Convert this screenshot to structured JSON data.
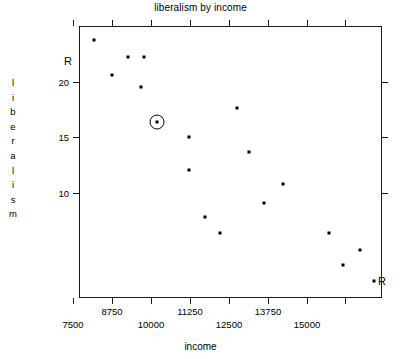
{
  "chart_data": {
    "type": "scatter",
    "title": "liberalism by income",
    "xlabel": "income",
    "ylabel": "liberalism",
    "xlim": [
      6900,
      16200
    ],
    "ylim": [
      7.1,
      23.6
    ],
    "grid": false,
    "legend": null,
    "xticks": [
      7500,
      8750,
      10000,
      11250,
      12500,
      13750,
      15000
    ],
    "xtick_labels": [
      "7500",
      "8750",
      "10000",
      "11250",
      "12500",
      "13750",
      "15000"
    ],
    "yticks": [
      20,
      15,
      10
    ],
    "ytick_labels": [
      "20",
      "15",
      "10"
    ],
    "x": [
      7960,
      9050,
      9560,
      8710,
      9470,
      10260,
      11810,
      10980,
      12230,
      10980,
      11460,
      12040,
      13050,
      13530,
      14700,
      15240,
      15720
    ],
    "y": [
      23.3,
      21.8,
      21.8,
      21.3,
      20.2,
      18.1,
      19.1,
      17.2,
      16.2,
      15.1,
      14.1,
      12.1,
      13.0,
      11.1,
      11.1,
      9.3,
      10.1
    ],
    "points": [
      {
        "x": 7960,
        "y": 23.3,
        "px": 94,
        "py": 40,
        "highlighted": false
      },
      {
        "x": 9050,
        "y": 21.8,
        "px": 128,
        "py": 57,
        "highlighted": false
      },
      {
        "x": 9560,
        "y": 21.8,
        "px": 144,
        "py": 57,
        "highlighted": false
      },
      {
        "x": 8710,
        "y": 21.3,
        "px": 112,
        "py": 75,
        "highlighted": false
      },
      {
        "x": 9470,
        "y": 20.2,
        "px": 141,
        "py": 87,
        "highlighted": false
      },
      {
        "x": 10260,
        "y": 18.1,
        "px": 157,
        "py": 122,
        "highlighted": true
      },
      {
        "x": 11810,
        "y": 19.1,
        "px": 237,
        "py": 108,
        "highlighted": false
      },
      {
        "x": 10980,
        "y": 17.2,
        "px": 189,
        "py": 137,
        "highlighted": false
      },
      {
        "x": 12230,
        "y": 16.2,
        "px": 249,
        "py": 152,
        "highlighted": false
      },
      {
        "x": 10980,
        "y": 15.1,
        "px": 189,
        "py": 170,
        "highlighted": false
      },
      {
        "x": 13530,
        "y": 14.1,
        "px": 283,
        "py": 184,
        "highlighted": false
      },
      {
        "x": 11460,
        "y": 12.1,
        "px": 205,
        "py": 217,
        "highlighted": false
      },
      {
        "x": 13050,
        "y": 13.0,
        "px": 264,
        "py": 203,
        "highlighted": false
      },
      {
        "x": 12040,
        "y": 11.1,
        "px": 220,
        "py": 233,
        "highlighted": false
      },
      {
        "x": 14700,
        "y": 11.1,
        "px": 329,
        "py": 233,
        "highlighted": false
      },
      {
        "x": 15720,
        "y": 10.1,
        "px": 360,
        "py": 250,
        "highlighted": false
      },
      {
        "x": 15240,
        "y": 9.3,
        "px": 343,
        "py": 265,
        "highlighted": false
      },
      {
        "x": 16000,
        "y": 8.0,
        "px": 374,
        "py": 281,
        "highlighted": false
      }
    ],
    "annotations": [
      {
        "text": "R",
        "position": "top-left-axis"
      },
      {
        "text": "R",
        "position": "bottom-right-corner"
      }
    ],
    "highlighted_point": {
      "x": 10260,
      "y": 18.1,
      "marker": "circle-ring"
    }
  },
  "axes": {
    "title": "liberalism by income",
    "x_title": "income",
    "y_title_letters": [
      "l",
      "i",
      "b",
      "e",
      "r",
      "a",
      "l",
      "i",
      "s",
      "m"
    ],
    "x_tick_labels": [
      {
        "label": "7500",
        "px": 73,
        "row": "far"
      },
      {
        "label": "8750",
        "px": 112,
        "row": "near"
      },
      {
        "label": "10000",
        "px": 151,
        "row": "far"
      },
      {
        "label": "11250",
        "px": 190,
        "row": "near"
      },
      {
        "label": "12500",
        "px": 229,
        "row": "far"
      },
      {
        "label": "13750",
        "px": 268,
        "row": "near"
      },
      {
        "label": "15000",
        "px": 307,
        "row": "far"
      }
    ],
    "x_tick_positions": [
      73,
      112,
      151,
      190,
      229,
      268,
      307,
      345
    ],
    "y_tick_labels": [
      {
        "label": "20",
        "py": 82
      },
      {
        "label": "15",
        "py": 137
      },
      {
        "label": "10",
        "py": 193
      }
    ]
  },
  "labels": {
    "r_top_left": "R",
    "r_bottom_right": "R"
  },
  "colors": {
    "background": "#ffffff",
    "foreground": "#000000",
    "axis": "#1a1a1a",
    "marker": "#000000"
  }
}
